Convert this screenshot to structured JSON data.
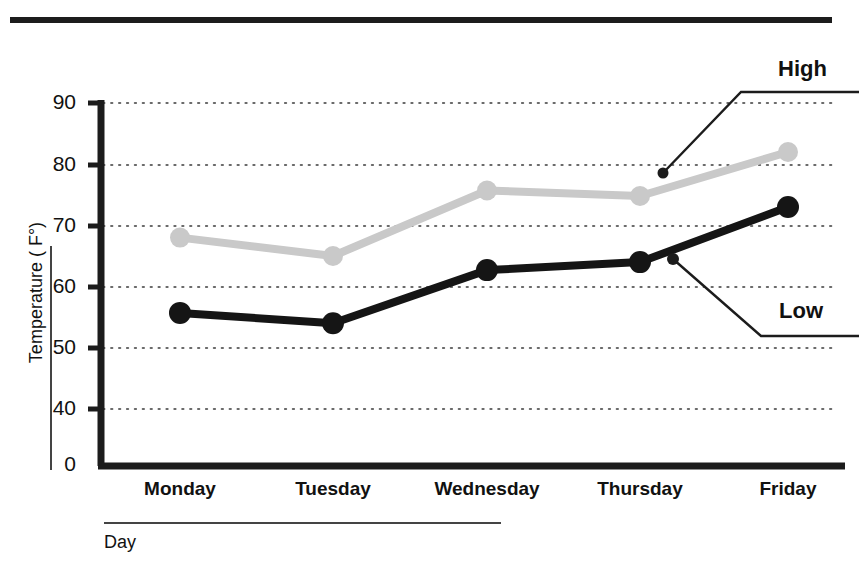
{
  "chart_data": {
    "type": "line",
    "title": "",
    "xlabel": "Day",
    "ylabel": "Temperature ( F°)",
    "categories": [
      "Monday",
      "Tuesday",
      "Wednesday",
      "Thursday",
      "Friday"
    ],
    "series": [
      {
        "name": "High",
        "color": "#c9c9c9",
        "values": [
          68,
          65,
          75.7,
          74.8,
          82
        ]
      },
      {
        "name": "Low",
        "color": "#151515",
        "values": [
          55.7,
          54,
          62.7,
          64,
          73
        ]
      }
    ],
    "ylim": [
      0,
      92
    ],
    "ytick_labels": [
      "0",
      "40",
      "50",
      "60",
      "70",
      "80",
      "90"
    ],
    "ytick_values": [
      0,
      40,
      50,
      60,
      70,
      80,
      90
    ],
    "grid": true,
    "grid_style": "dotted",
    "axis_break": true,
    "legend_position": "annotations-right",
    "annotations": [
      {
        "text": "High",
        "target_series": "High",
        "target_category": "Friday"
      },
      {
        "text": "Low",
        "target_series": "Low",
        "target_category": "Friday"
      }
    ]
  },
  "axes": {
    "y_title": "Temperature ( F°)",
    "x_title": "Day",
    "y_ticks": [
      {
        "label": "90",
        "y": 103
      },
      {
        "label": "80",
        "y": 165
      },
      {
        "label": "70",
        "y": 226
      },
      {
        "label": "60",
        "y": 287
      },
      {
        "label": "50",
        "y": 348
      },
      {
        "label": "40",
        "y": 409
      },
      {
        "label": "0",
        "y": 466
      }
    ],
    "x_ticks": [
      {
        "label": "Monday",
        "x": 180
      },
      {
        "label": "Tuesday",
        "x": 333
      },
      {
        "label": "Wednesday",
        "x": 487
      },
      {
        "label": "Thursday",
        "x": 640
      },
      {
        "label": "Friday",
        "x": 788
      }
    ]
  },
  "annotations": {
    "high_label": "High",
    "low_label": "Low"
  },
  "header": {
    "title_fragment": ""
  }
}
